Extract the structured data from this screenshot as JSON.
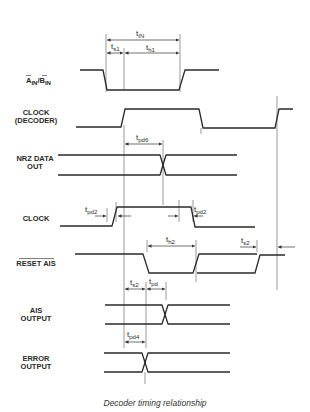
{
  "figure": {
    "caption": "Decoder timing relationship",
    "colors": {
      "ink": "#2a2a2a",
      "background": "#ffffff"
    }
  },
  "signals": [
    {
      "id": "ain_bin",
      "label_line1": "A",
      "label_line1_sub": "IN",
      "label_sep": "/",
      "label_line1b": "B",
      "label_line1b_sub": "IN",
      "overbar": "A_IN and B_IN inverted"
    },
    {
      "id": "clock_decoder",
      "label_line1": "CLOCK",
      "label_line2": "(DECODER)"
    },
    {
      "id": "nrz_data_out",
      "label_line1": "NRZ DATA",
      "label_line2": "OUT"
    },
    {
      "id": "clock",
      "label_line1": "CLOCK"
    },
    {
      "id": "reset_ais",
      "label_line1": "RESET AIS",
      "overbar": true
    },
    {
      "id": "ais_output",
      "label_line1": "AIS",
      "label_line2": "OUTPUT"
    },
    {
      "id": "error_output",
      "label_line1": "ERROR",
      "label_line2": "OUTPUT"
    }
  ],
  "timing_params": {
    "t_in": {
      "base": "t",
      "sub": "IN"
    },
    "t_s1": {
      "base": "t",
      "sub": "s1"
    },
    "t_h1": {
      "base": "t",
      "sub": "h1"
    },
    "t_pd6": {
      "base": "t",
      "sub": "pd6"
    },
    "t_pd2_left": {
      "base": "t",
      "sub": "pd2"
    },
    "t_pd2_right": {
      "base": "t",
      "sub": "pd2"
    },
    "t_h2": {
      "base": "t",
      "sub": "h2"
    },
    "t_s2_reset": {
      "base": "t",
      "sub": "s2"
    },
    "t_s2_ais": {
      "base": "t",
      "sub": "s2"
    },
    "t_pd": {
      "base": "t",
      "sub": "pd"
    },
    "t_pd4": {
      "base": "t",
      "sub": "pd4"
    }
  }
}
